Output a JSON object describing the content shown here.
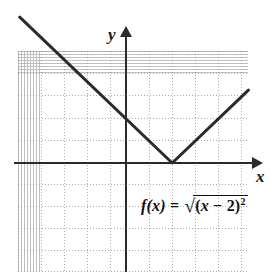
{
  "figure": {
    "type": "graph",
    "background_color": "#ffffff",
    "grid_color": "#9a9a9a",
    "axis_color": "#2b2b2b",
    "curve_color": "#2b2b2b"
  },
  "axes": {
    "x_label": "x",
    "y_label": "y",
    "x_arrow_icon": "arrow-right-icon",
    "y_arrow_icon": "arrow-up-icon"
  },
  "equation": {
    "function_name": "f",
    "argument": "(x)",
    "equals": "=",
    "sqrt_symbol": "√",
    "radicand_open": "(",
    "radicand_variable": "x",
    "radicand_operator": "−",
    "radicand_number": "2",
    "radicand_close": ")",
    "exponent": "2",
    "full_text": "f(x) = √((x − 2)²)"
  },
  "chart_data": {
    "type": "line",
    "title": "",
    "subtitle": "",
    "xlabel": "x",
    "ylabel": "y",
    "xlim": [
      -5,
      5
    ],
    "ylim": [
      -5,
      5
    ],
    "grid": true,
    "grid_style": "dotted",
    "grid_spacing": 1,
    "legend": false,
    "legend_position": "none",
    "annotations": [
      "f(x) = √((x − 2)²)"
    ],
    "series": [
      {
        "name": "f(x) = sqrt((x-2)^2)",
        "equation": "f(x) = |x - 2|",
        "vertex": [
          2,
          0
        ],
        "x": [
          -4.6,
          2,
          5.3
        ],
        "y": [
          6.6,
          0,
          3.3
        ],
        "line_width": 3,
        "color": "#2b2b2b"
      }
    ],
    "tick_labels_x": [],
    "tick_labels_y": []
  }
}
